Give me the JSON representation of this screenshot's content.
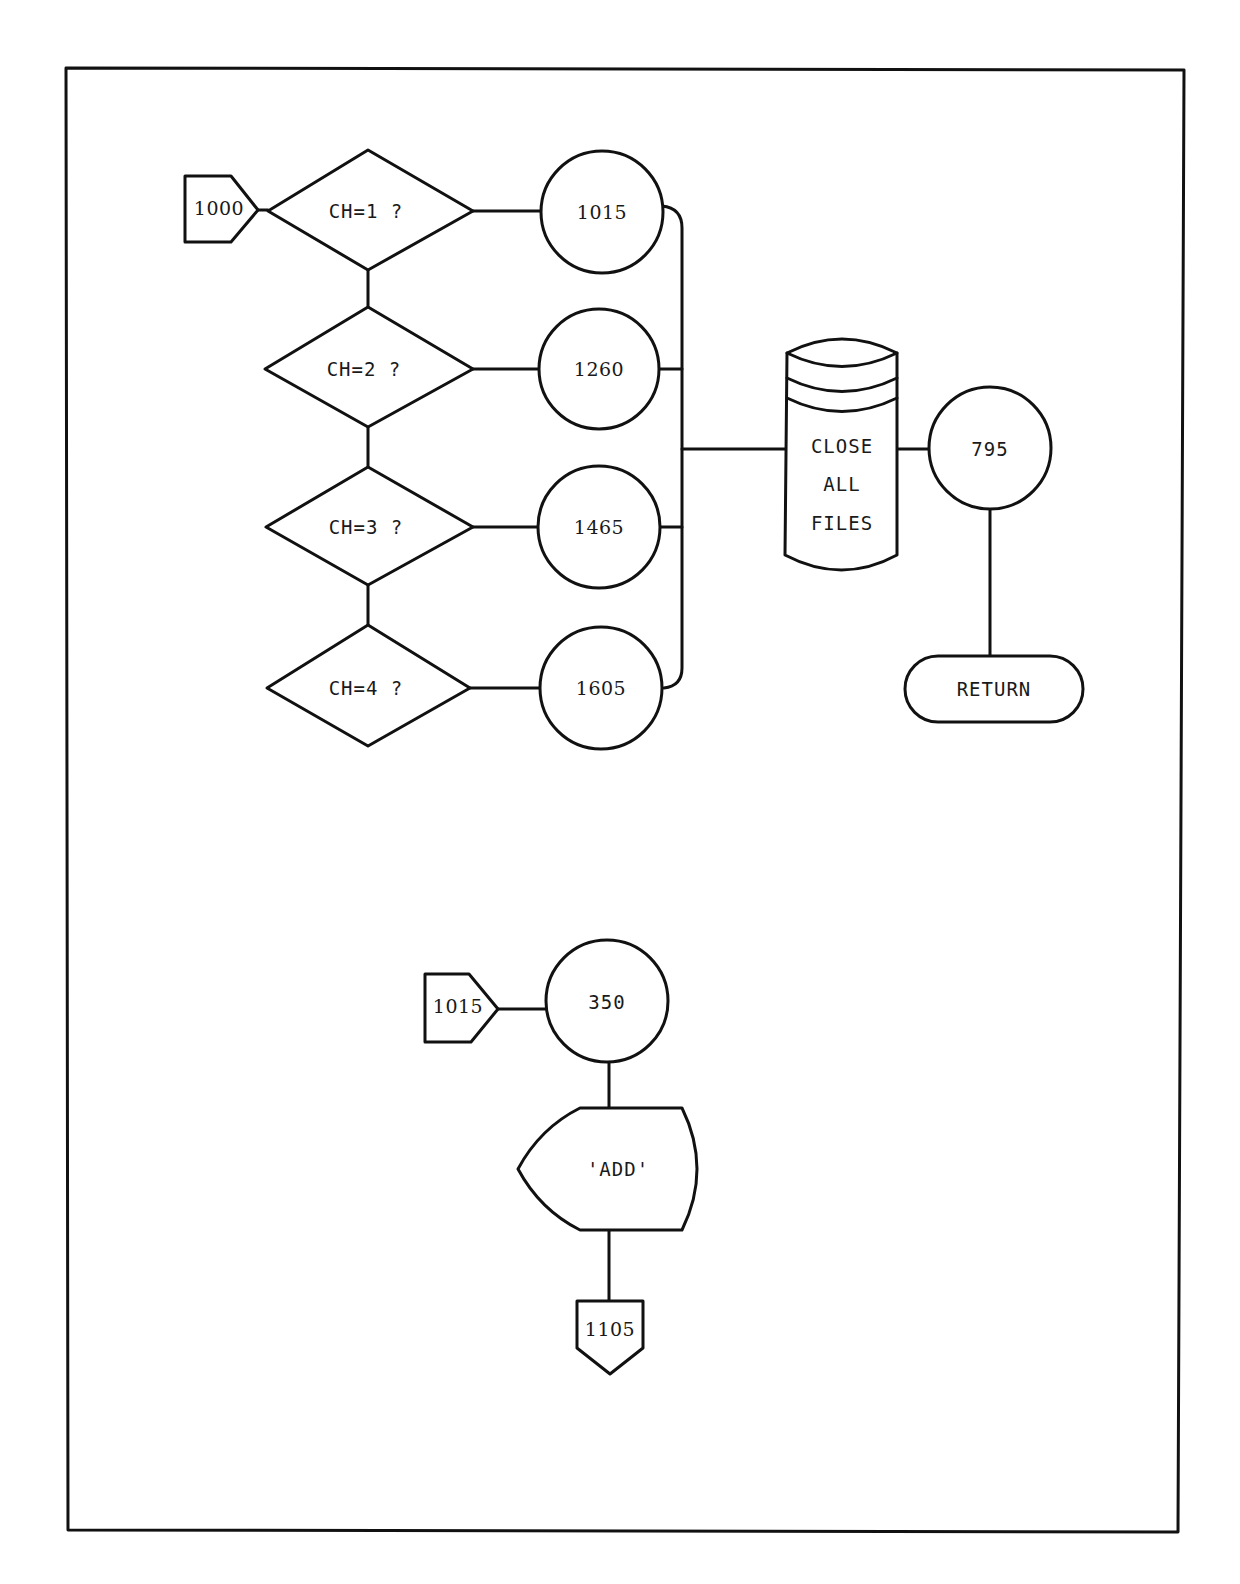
{
  "page": {
    "frame": {
      "x": 66,
      "y": 68,
      "width": 1114,
      "height": 1464
    }
  },
  "diagram_top": {
    "entry_connector": {
      "label": "1000"
    },
    "decisions": [
      {
        "label": "CH=1  ?",
        "target": "1015"
      },
      {
        "label": "CH=2  ?",
        "target": "1260"
      },
      {
        "label": "CH=3  ?",
        "target": "1465"
      },
      {
        "label": "CH=4  ?",
        "target": "1605"
      }
    ],
    "subroutines": [
      {
        "label": "1015"
      },
      {
        "label": "1260"
      },
      {
        "label": "1465"
      },
      {
        "label": "1605"
      }
    ],
    "storage": {
      "lines": [
        "CLOSE",
        "ALL",
        "FILES"
      ]
    },
    "after_storage": {
      "label": "795"
    },
    "terminal": {
      "label": "RETURN"
    }
  },
  "diagram_bottom": {
    "entry_connector": {
      "label": "1015"
    },
    "subroutine": {
      "label": "350"
    },
    "display": {
      "label": "'ADD'"
    },
    "exit_connector": {
      "label": "1105"
    }
  }
}
